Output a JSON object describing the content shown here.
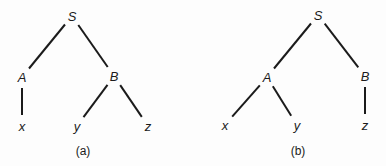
{
  "background": "#fdfdfd",
  "ink": "#1b1b1b",
  "edge_stroke_width": 2,
  "edge_gap": 11,
  "diagram": {
    "type": "tree",
    "trees": [
      {
        "caption": "(a)",
        "caption_pos": {
          "x": 83,
          "y": 155
        },
        "nodes": [
          {
            "id": "S",
            "label": "S",
            "x": 72,
            "y": 16
          },
          {
            "id": "A",
            "label": "A",
            "x": 22,
            "y": 77
          },
          {
            "id": "B",
            "label": "B",
            "x": 114,
            "y": 76
          },
          {
            "id": "x",
            "label": "x",
            "x": 22,
            "y": 126
          },
          {
            "id": "y",
            "label": "y",
            "x": 77,
            "y": 126
          },
          {
            "id": "z",
            "label": "z",
            "x": 148,
            "y": 126
          }
        ],
        "edges": [
          [
            "S",
            "A"
          ],
          [
            "S",
            "B"
          ],
          [
            "A",
            "x"
          ],
          [
            "B",
            "y"
          ],
          [
            "B",
            "z"
          ]
        ]
      },
      {
        "caption": "(b)",
        "caption_pos": {
          "x": 105,
          "y": 155
        },
        "nodes": [
          {
            "id": "S",
            "label": "S",
            "x": 125,
            "y": 15
          },
          {
            "id": "A",
            "label": "A",
            "x": 74,
            "y": 77
          },
          {
            "id": "B",
            "label": "B",
            "x": 172,
            "y": 76
          },
          {
            "id": "x",
            "label": "x",
            "x": 32,
            "y": 125
          },
          {
            "id": "y",
            "label": "y",
            "x": 104,
            "y": 125
          },
          {
            "id": "z",
            "label": "z",
            "x": 172,
            "y": 125
          }
        ],
        "edges": [
          [
            "S",
            "A"
          ],
          [
            "S",
            "B"
          ],
          [
            "A",
            "x"
          ],
          [
            "A",
            "y"
          ],
          [
            "B",
            "z"
          ]
        ]
      }
    ]
  }
}
